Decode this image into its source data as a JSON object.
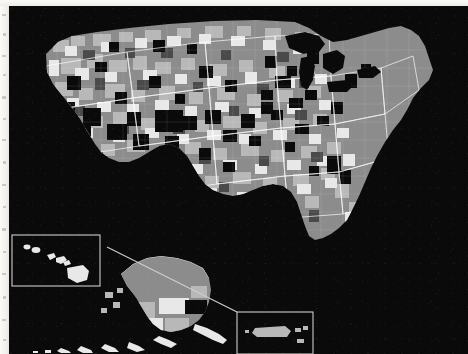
{
  "figure": {
    "type": "choropleth-map",
    "projection": "albers-usa",
    "background_color": "#0a0a0a",
    "paper_color": "#f6f4f0",
    "border_color": "#ffffff",
    "rendering": "grayscale halftone scan"
  },
  "palette": {
    "tone_black": "#0a0a0a",
    "tone_dark_gray": "#4a4a4a",
    "tone_medium_gray": "#8c8c8c",
    "tone_light_gray": "#b8b8b8",
    "tone_near_white": "#e8e8e8",
    "border_white": "#ffffff",
    "inset_frame": "#cfcdc8"
  },
  "classes": [
    {
      "id": "c1",
      "label": "lowest",
      "color": "#0a0a0a"
    },
    {
      "id": "c2",
      "label": "low",
      "color": "#4a4a4a"
    },
    {
      "id": "c3",
      "label": "medium",
      "color": "#8c8c8c"
    },
    {
      "id": "c4",
      "label": "high",
      "color": "#b8b8b8"
    },
    {
      "id": "c5",
      "label": "highest",
      "color": "#e8e8e8"
    }
  ],
  "insets": [
    {
      "name": "hawaii",
      "framed": true,
      "x": 3,
      "y": 229,
      "w": 88,
      "h": 51
    },
    {
      "name": "alaska",
      "framed": false,
      "x": 88,
      "y": 240,
      "w": 150,
      "h": 108
    },
    {
      "name": "puerto-rico",
      "framed": true,
      "x": 228,
      "y": 306,
      "w": 76,
      "h": 42
    }
  ],
  "leader": {
    "from_x": 228,
    "from_y": 306,
    "to_x": 98,
    "to_y": 241
  },
  "regions": {
    "contiguous": "lower 48 states",
    "alaska": "Alaska with Aleutian chain",
    "hawaii": "Hawaiian island chain",
    "puerto_rico": "Puerto Rico and Virgin Islands"
  },
  "features": {
    "great_lakes": [
      "Superior",
      "Michigan",
      "Huron",
      "Erie",
      "Ontario"
    ],
    "state_outlines_visible": true,
    "county_outlines_visible": true
  }
}
